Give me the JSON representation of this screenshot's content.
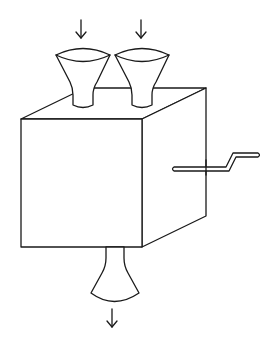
{
  "diagram": {
    "type": "machine-schematic",
    "colors": {
      "stroke": "#1a1a1a",
      "background": "#ffffff"
    },
    "components": [
      {
        "id": "input-funnel-left",
        "kind": "funnel",
        "flow": "in"
      },
      {
        "id": "input-funnel-right",
        "kind": "funnel",
        "flow": "in"
      },
      {
        "id": "box",
        "kind": "cube"
      },
      {
        "id": "crank-handle",
        "kind": "handle"
      },
      {
        "id": "output-nozzle",
        "kind": "nozzle",
        "flow": "out"
      }
    ],
    "arrows": [
      {
        "id": "input-arrow-left",
        "direction": "down"
      },
      {
        "id": "input-arrow-right",
        "direction": "down"
      },
      {
        "id": "output-arrow",
        "direction": "down"
      }
    ]
  }
}
